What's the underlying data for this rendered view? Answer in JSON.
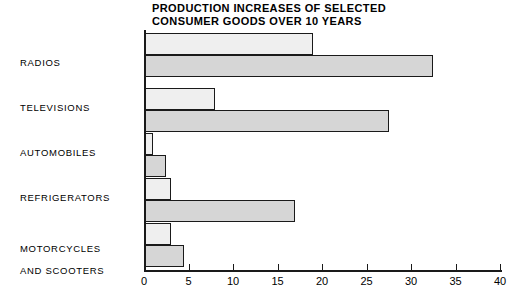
{
  "chart_data": {
    "type": "bar",
    "orientation": "horizontal",
    "title": "PRODUCTION INCREASES OF SELECTED CONSUMER GOODS OVER 10 YEARS",
    "title_lines": [
      "PRODUCTION INCREASES OF SELECTED",
      "CONSUMER GOODS OVER 10 YEARS"
    ],
    "xlabel": "",
    "ylabel": "",
    "xlim": [
      0,
      40
    ],
    "xticks": [
      0,
      5,
      10,
      15,
      20,
      25,
      30,
      35,
      40
    ],
    "xtick_labels": [
      "0",
      "5",
      "10",
      "15",
      "20",
      "25",
      "30",
      "35",
      "40"
    ],
    "grid": false,
    "legend": "none",
    "categories": [
      "RADIOS",
      "TELEVISIONS",
      "AUTOMOBILES",
      "REFRIGERATORS",
      "MOTORCYCLES AND SCOOTERS"
    ],
    "category_label_lines": [
      [
        "RADIOS"
      ],
      [
        "TELEVISIONS"
      ],
      [
        "AUTOMOBILES"
      ],
      [
        "REFRIGERATORS"
      ],
      [
        "MOTORCYCLES",
        "AND SCOOTERS"
      ]
    ],
    "series": [
      {
        "name": "first-period",
        "color": "#efefef",
        "values": [
          19,
          8,
          1,
          3,
          3
        ]
      },
      {
        "name": "second-period",
        "color": "#d6d6d6",
        "values": [
          32.5,
          27.5,
          2.5,
          17,
          4.5
        ]
      }
    ],
    "colors": {
      "series_first": "#efefef",
      "series_second": "#d6d6d6",
      "axis": "#1a1a1a",
      "background": "#ffffff"
    }
  }
}
